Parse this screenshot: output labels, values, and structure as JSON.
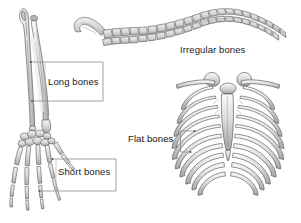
{
  "figure": {
    "background_color": "#ffffff",
    "line_color": "#3a3a3a",
    "bone_fill": "#d9d9d9",
    "bone_shadow": "#b0b0b0",
    "bone_highlight": "#f2f2f2",
    "label_color": "#1a1a1a",
    "callout_color": "#808080"
  },
  "labels": {
    "long_bones": "Long bones",
    "short_bones": "Short bones",
    "irregular_bones": "Irregular bones",
    "flat_bones": "Flat bones"
  },
  "specimens": [
    {
      "name": "forearm-and-hand-skeleton",
      "label": "Long bones",
      "second_label": "Short bones",
      "parts": [
        "ulna",
        "radius",
        "carpals",
        "metacarpals",
        "phalanges"
      ]
    },
    {
      "name": "vertebral-column",
      "label": "Irregular bones",
      "parts": [
        "sacrum",
        "coccyx",
        "lumbar vertebrae",
        "thoracic vertebrae",
        "cervical vertebrae"
      ]
    },
    {
      "name": "rib-cage-thorax",
      "label": "Flat bones",
      "parts": [
        "clavicle",
        "scapula",
        "sternum",
        "ribs"
      ]
    }
  ]
}
